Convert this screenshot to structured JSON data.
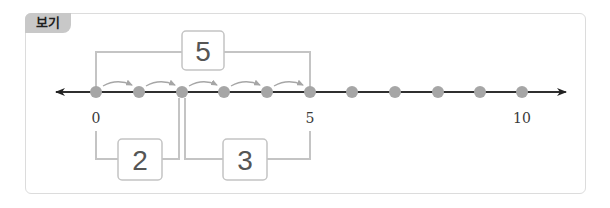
{
  "label": "보기",
  "number_line": {
    "min": 0,
    "max": 10,
    "tick_labels": [
      {
        "value": 0,
        "text": "0"
      },
      {
        "value": 5,
        "text": "5"
      },
      {
        "value": 10,
        "text": "10"
      }
    ],
    "points": [
      0,
      1,
      2,
      3,
      4,
      5,
      6,
      7,
      8,
      9,
      10
    ],
    "hops": [
      [
        0,
        1
      ],
      [
        1,
        2
      ],
      [
        2,
        3
      ],
      [
        3,
        4
      ],
      [
        4,
        5
      ]
    ]
  },
  "brackets": {
    "top": {
      "from": 0,
      "to": 5,
      "value": "5"
    },
    "bottom_left": {
      "from": 0,
      "to": 2,
      "value": "2"
    },
    "bottom_right": {
      "from": 2,
      "to": 5,
      "value": "3"
    }
  },
  "colors": {
    "dot": "#a6a6a6",
    "bracket": "#c4c4c4",
    "line": "#222222",
    "tag_bg": "#c8c8c8"
  }
}
